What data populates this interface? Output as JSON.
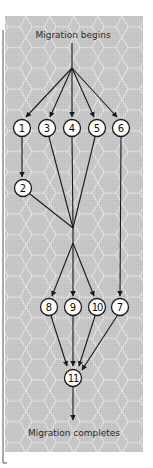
{
  "diagram": {
    "title_top": "Migration begins",
    "title_bottom": "Migration completes",
    "colors": {
      "panel_bg": "#c9c9c9",
      "hex_stroke": "#ececec",
      "line": "#1a1a1a",
      "node_fill": "#ffffff",
      "bracket": "#555555"
    },
    "nodes": [
      {
        "id": "1",
        "label": "1",
        "x": 22,
        "y": 128
      },
      {
        "id": "3",
        "label": "3",
        "x": 47,
        "y": 128
      },
      {
        "id": "4",
        "label": "4",
        "x": 72,
        "y": 128
      },
      {
        "id": "5",
        "label": "5",
        "x": 97,
        "y": 128
      },
      {
        "id": "6",
        "label": "6",
        "x": 121,
        "y": 128
      },
      {
        "id": "2",
        "label": "2",
        "x": 23,
        "y": 188
      },
      {
        "id": "8",
        "label": "8",
        "x": 49,
        "y": 307
      },
      {
        "id": "9",
        "label": "9",
        "x": 73,
        "y": 307
      },
      {
        "id": "10",
        "label": "10",
        "x": 97,
        "y": 307
      },
      {
        "id": "7",
        "label": "7",
        "x": 120,
        "y": 307
      },
      {
        "id": "11",
        "label": "11",
        "x": 73,
        "y": 378
      }
    ],
    "edges": [
      {
        "from": "start",
        "to": "1"
      },
      {
        "from": "start",
        "to": "3"
      },
      {
        "from": "start",
        "to": "4"
      },
      {
        "from": "start",
        "to": "5"
      },
      {
        "from": "start",
        "to": "6"
      },
      {
        "from": "1",
        "to": "2"
      },
      {
        "from": "2",
        "to": "join"
      },
      {
        "from": "3",
        "to": "join"
      },
      {
        "from": "4",
        "to": "join"
      },
      {
        "from": "5",
        "to": "join"
      },
      {
        "from": "6",
        "to": "7"
      },
      {
        "from": "join",
        "to": "8"
      },
      {
        "from": "join",
        "to": "9"
      },
      {
        "from": "join",
        "to": "10"
      },
      {
        "from": "8",
        "to": "11"
      },
      {
        "from": "9",
        "to": "11"
      },
      {
        "from": "10",
        "to": "11"
      },
      {
        "from": "7",
        "to": "11"
      },
      {
        "from": "11",
        "to": "end"
      }
    ]
  }
}
